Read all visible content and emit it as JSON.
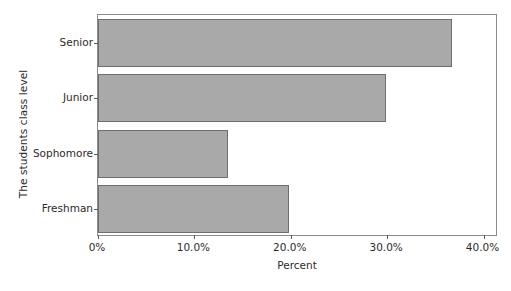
{
  "chart_data": {
    "type": "bar",
    "orientation": "horizontal",
    "title": "",
    "xlabel": "Percent",
    "ylabel": "The students class level",
    "categories": [
      "Freshman",
      "Sophomore",
      "Junior",
      "Senior"
    ],
    "values": [
      19.8,
      13.5,
      29.9,
      36.7
    ],
    "xlim": [
      0,
      41.5
    ],
    "xticks": [
      0,
      10,
      20,
      30,
      40
    ],
    "xtick_labels": [
      "0%",
      "10.0%",
      "20.0%",
      "30.0%",
      "40.0%"
    ],
    "grid": false,
    "legend": false,
    "bar_color": "#a9a9a9",
    "bar_edge_color": "#6e6e6e",
    "frame_color": "#8a8a8a",
    "background": "#ffffff"
  },
  "axes": {
    "y_title": "The students class level",
    "x_title": "Percent"
  },
  "categories": [
    {
      "label": "Senior",
      "value": 36.7
    },
    {
      "label": "Junior",
      "value": 29.9
    },
    {
      "label": "Sophomore",
      "value": 13.5
    },
    {
      "label": "Freshman",
      "value": 19.8
    }
  ],
  "xticks": [
    {
      "label": "0%",
      "value": 0
    },
    {
      "label": "10.0%",
      "value": 10
    },
    {
      "label": "20.0%",
      "value": 20
    },
    {
      "label": "30.0%",
      "value": 30
    },
    {
      "label": "40.0%",
      "value": 40
    }
  ]
}
